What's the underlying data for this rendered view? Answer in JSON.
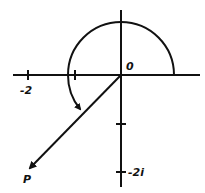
{
  "diagram": {
    "title": "",
    "labels": {
      "origin": "0",
      "x_tick_neg2": "-2",
      "y_tick_neg2i": "-2i",
      "point": "P"
    },
    "colors": {
      "stroke": "#111111",
      "background": "#ffffff"
    }
  }
}
